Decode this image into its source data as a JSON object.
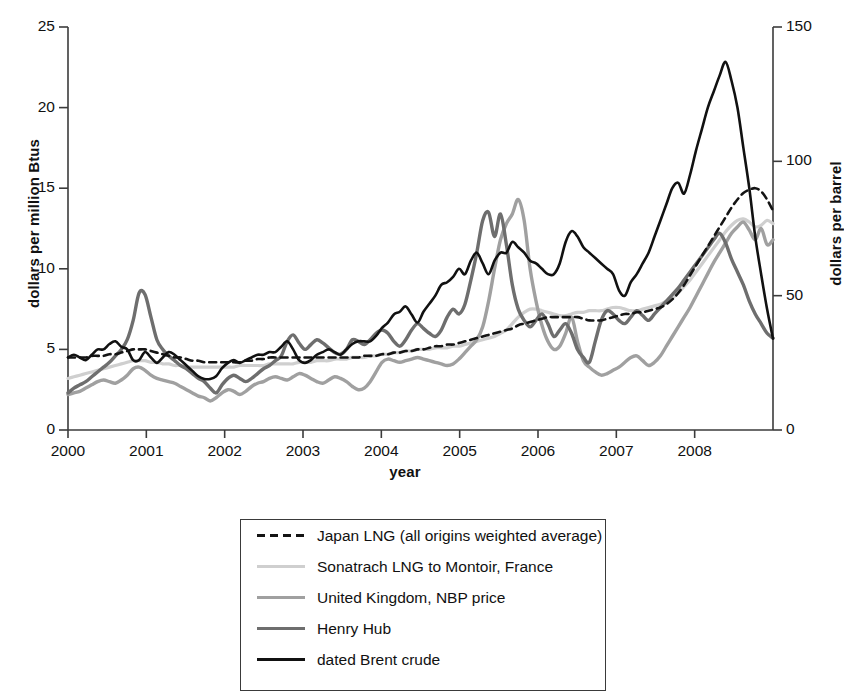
{
  "chart_data": {
    "type": "line",
    "title": "",
    "xlabel": "year",
    "ylabel": "dollars per million Btus",
    "ylabel_right": "dollars per barrel",
    "xlim": [
      2000,
      2009
    ],
    "ylim": [
      0,
      25
    ],
    "ylim_right": [
      0,
      150
    ],
    "grid": false,
    "legend_position": "below",
    "xticks": [
      "2000",
      "2001",
      "2002",
      "2003",
      "2004",
      "2005",
      "2006",
      "2007",
      "2008"
    ],
    "yticks_left": [
      "0",
      "5",
      "10",
      "15",
      "20",
      "25"
    ],
    "yticks_right": [
      "0",
      "50",
      "100",
      "150"
    ],
    "series": [
      {
        "name": "Japan LNG (all origins weighted average)",
        "style": "dashed",
        "color": "#141414",
        "width": 2.6,
        "axis": "left",
        "values": [
          4.5,
          4.5,
          4.5,
          4.5,
          4.6,
          4.6,
          4.6,
          4.7,
          4.7,
          4.8,
          4.9,
          5.0,
          5.0,
          5.0,
          4.9,
          4.8,
          4.7,
          4.6,
          4.5,
          4.5,
          4.4,
          4.3,
          4.3,
          4.2,
          4.2,
          4.2,
          4.2,
          4.2,
          4.2,
          4.2,
          4.3,
          4.3,
          4.4,
          4.4,
          4.5,
          4.5,
          4.5,
          4.5,
          4.5,
          4.5,
          4.5,
          4.5,
          4.5,
          4.5,
          4.5,
          4.5,
          4.5,
          4.5,
          4.5,
          4.5,
          4.6,
          4.6,
          4.6,
          4.7,
          4.7,
          4.8,
          4.8,
          4.9,
          4.9,
          5.0,
          5.0,
          5.1,
          5.2,
          5.2,
          5.3,
          5.3,
          5.4,
          5.5,
          5.6,
          5.7,
          5.8,
          5.9,
          6.0,
          6.1,
          6.2,
          6.3,
          6.5,
          6.6,
          6.7,
          6.8,
          6.9,
          7.0,
          7.0,
          7.0,
          7.0,
          7.0,
          7.0,
          6.9,
          6.8,
          6.8,
          6.8,
          6.9,
          7.0,
          7.1,
          7.2,
          7.2,
          7.3,
          7.3,
          7.4,
          7.5,
          7.6,
          7.8,
          8.1,
          8.5,
          9.0,
          9.6,
          10.2,
          10.8,
          11.4,
          12.0,
          12.6,
          13.2,
          13.8,
          14.3,
          14.7,
          14.9,
          15.0,
          14.8,
          14.3,
          13.6
        ]
      },
      {
        "name": "Sonatrach LNG to Montoir, France",
        "style": "solid",
        "color": "#cfcfcf",
        "width": 3.2,
        "axis": "left",
        "values": [
          3.2,
          3.3,
          3.4,
          3.5,
          3.6,
          3.7,
          3.8,
          3.9,
          4.0,
          4.1,
          4.2,
          4.3,
          4.3,
          4.3,
          4.2,
          4.2,
          4.1,
          4.1,
          4.0,
          4.0,
          3.9,
          3.9,
          3.9,
          3.9,
          3.9,
          3.9,
          3.9,
          3.9,
          3.9,
          4.0,
          4.0,
          4.0,
          4.0,
          4.0,
          4.1,
          4.1,
          4.1,
          4.1,
          4.1,
          4.2,
          4.2,
          4.2,
          4.3,
          4.3,
          4.3,
          4.4,
          4.4,
          4.4,
          4.5,
          4.5,
          4.5,
          4.6,
          4.6,
          4.7,
          4.7,
          4.8,
          4.8,
          4.9,
          4.9,
          5.0,
          5.0,
          5.0,
          5.1,
          5.1,
          5.1,
          5.2,
          5.2,
          5.3,
          5.4,
          5.5,
          5.6,
          5.7,
          5.8,
          6.0,
          6.2,
          6.6,
          7.0,
          7.3,
          7.5,
          7.5,
          7.4,
          7.3,
          7.2,
          7.1,
          7.1,
          7.2,
          7.3,
          7.3,
          7.4,
          7.4,
          7.4,
          7.5,
          7.6,
          7.6,
          7.5,
          7.4,
          7.4,
          7.5,
          7.6,
          7.7,
          7.8,
          8.0,
          8.2,
          8.5,
          8.9,
          9.3,
          9.8,
          10.3,
          10.8,
          11.3,
          11.8,
          12.3,
          12.7,
          13.0,
          13.1,
          12.9,
          12.6,
          12.7,
          13.0,
          12.8
        ]
      },
      {
        "name": "United Kingdom, NBP price",
        "style": "solid",
        "color": "#a0a0a0",
        "width": 3.4,
        "axis": "left",
        "values": [
          2.2,
          2.3,
          2.4,
          2.6,
          2.8,
          3.0,
          3.1,
          3.0,
          2.9,
          3.1,
          3.4,
          3.8,
          3.9,
          3.7,
          3.4,
          3.2,
          3.1,
          3.0,
          2.9,
          2.7,
          2.5,
          2.3,
          2.1,
          2.0,
          1.8,
          2.0,
          2.3,
          2.5,
          2.4,
          2.2,
          2.4,
          2.7,
          2.9,
          3.0,
          3.2,
          3.3,
          3.2,
          3.1,
          3.3,
          3.5,
          3.4,
          3.2,
          3.0,
          2.9,
          3.1,
          3.3,
          3.2,
          3.0,
          2.7,
          2.5,
          2.6,
          3.0,
          3.6,
          4.2,
          4.4,
          4.3,
          4.2,
          4.3,
          4.4,
          4.5,
          4.4,
          4.3,
          4.2,
          4.1,
          4.0,
          4.1,
          4.4,
          4.8,
          5.2,
          5.6,
          6.4,
          8.0,
          10.0,
          11.8,
          12.8,
          13.4,
          14.3,
          13.0,
          10.0,
          8.0,
          6.5,
          5.5,
          5.0,
          5.2,
          6.0,
          7.0,
          5.5,
          4.3,
          3.9,
          3.6,
          3.4,
          3.5,
          3.7,
          3.9,
          4.2,
          4.5,
          4.6,
          4.3,
          4.0,
          4.2,
          4.6,
          5.2,
          5.8,
          6.4,
          7.0,
          7.6,
          8.3,
          9.0,
          9.7,
          10.4,
          11.0,
          11.6,
          12.2,
          12.6,
          12.9,
          12.4,
          11.8,
          12.5,
          11.5,
          11.8
        ]
      },
      {
        "name": "Henry Hub",
        "style": "solid",
        "color": "#6e6e6e",
        "width": 3.4,
        "axis": "left",
        "values": [
          2.3,
          2.6,
          2.8,
          3.0,
          3.3,
          3.6,
          3.9,
          4.2,
          4.6,
          5.0,
          5.6,
          6.8,
          8.5,
          8.4,
          7.0,
          5.6,
          5.0,
          4.6,
          4.3,
          4.0,
          3.8,
          3.5,
          3.2,
          3.0,
          2.6,
          2.3,
          2.8,
          3.2,
          3.4,
          3.2,
          3.0,
          3.2,
          3.5,
          3.8,
          4.0,
          4.3,
          4.6,
          5.5,
          5.9,
          5.4,
          5.0,
          5.3,
          5.6,
          5.4,
          5.1,
          4.8,
          4.7,
          5.0,
          5.6,
          5.5,
          5.3,
          5.6,
          6.0,
          6.2,
          6.0,
          5.5,
          5.2,
          5.6,
          6.2,
          6.6,
          6.3,
          6.0,
          5.8,
          6.2,
          7.0,
          7.5,
          7.2,
          7.8,
          9.3,
          11.0,
          13.0,
          13.5,
          12.0,
          13.4,
          11.5,
          9.0,
          7.5,
          6.8,
          6.4,
          6.8,
          7.2,
          6.6,
          5.8,
          6.2,
          6.6,
          6.0,
          5.0,
          4.5,
          4.2,
          5.5,
          6.8,
          7.4,
          7.2,
          6.8,
          6.6,
          7.0,
          7.4,
          7.1,
          6.8,
          7.2,
          7.6,
          8.0,
          8.4,
          8.8,
          9.3,
          9.8,
          10.3,
          10.8,
          11.3,
          11.8,
          12.2,
          11.6,
          10.6,
          9.8,
          9.0,
          8.0,
          7.2,
          6.6,
          6.0,
          5.7
        ]
      },
      {
        "name": "dated Brent crude",
        "style": "solid",
        "color": "#111111",
        "width": 2.6,
        "axis": "right",
        "values": [
          27,
          28,
          27,
          26,
          28,
          30,
          30,
          32,
          33,
          31,
          30,
          26,
          26,
          29,
          27,
          25,
          27,
          29,
          28,
          26,
          24,
          22,
          20,
          19,
          19,
          20,
          23,
          25,
          26,
          25,
          26,
          27,
          28,
          28,
          29,
          29,
          31,
          33,
          30,
          26,
          25,
          26,
          28,
          29,
          30,
          29,
          28,
          30,
          32,
          33,
          33,
          33,
          35,
          38,
          40,
          43,
          44,
          46,
          43,
          40,
          44,
          47,
          50,
          54,
          55,
          57,
          60,
          58,
          63,
          66,
          62,
          58,
          63,
          66,
          66,
          70,
          68,
          66,
          63,
          62,
          60,
          58,
          58,
          62,
          70,
          74,
          72,
          68,
          66,
          64,
          62,
          60,
          58,
          52,
          50,
          55,
          58,
          62,
          66,
          72,
          78,
          84,
          90,
          92,
          88,
          95,
          104,
          112,
          120,
          126,
          132,
          137,
          130,
          120,
          105,
          90,
          72,
          58,
          45,
          34
        ]
      }
    ]
  },
  "axes": {
    "left_title": "dollars per million Btus",
    "right_title": "dollars per barrel",
    "x_title": "year"
  },
  "legend": {
    "items": [
      {
        "label": "Japan LNG (all origins weighted average)"
      },
      {
        "label": "Sonatrach LNG to Montoir, France"
      },
      {
        "label": "United Kingdom, NBP price"
      },
      {
        "label": "Henry Hub"
      },
      {
        "label": "dated Brent crude"
      }
    ]
  }
}
